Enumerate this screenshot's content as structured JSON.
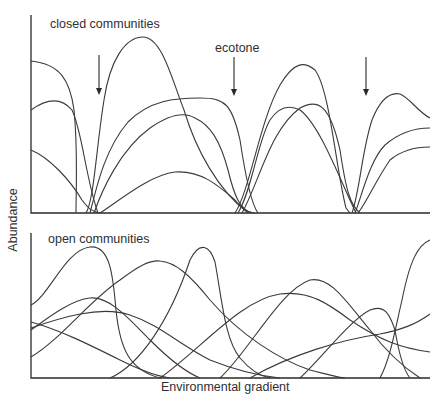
{
  "figure": {
    "top_panel": {
      "title": "closed communities",
      "annotation": "ecotone",
      "arrow_count": 3
    },
    "bottom_panel": {
      "title": "open communities"
    },
    "x_axis_label": "Environmental gradient",
    "y_axis_label": "Abundance",
    "colors": {
      "line": "#3a3a3a",
      "text": "#2f2f2f",
      "background": "#ffffff"
    }
  }
}
